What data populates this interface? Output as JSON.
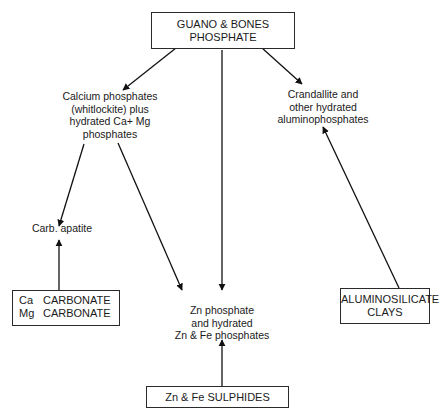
{
  "diagram": {
    "nodes": {
      "guano": {
        "lines": [
          "GUANO & BONES",
          "PHOSPHATE"
        ]
      },
      "calcium": {
        "lines": [
          "Calcium phosphates",
          "(whitlockite) plus",
          "hydrated Ca+ Mg",
          "phosphates"
        ]
      },
      "crandallite": {
        "lines": [
          "Crandallite and",
          "other hydrated",
          "aluminophosphates"
        ]
      },
      "carb_apatite": {
        "lines": [
          "Carb. apatite"
        ]
      },
      "zn_phosphate": {
        "lines": [
          "Zn phosphate",
          "and hydrated",
          "Zn & Fe phosphates"
        ]
      },
      "carbonate": {
        "rows": [
          {
            "element": "Ca",
            "label": "CARBONATE"
          },
          {
            "element": "Mg",
            "label": "CARBONATE"
          }
        ]
      },
      "aluminosilicate": {
        "lines": [
          "ALUMINOSILICATE",
          "CLAYS"
        ]
      },
      "sulphides": {
        "lines": [
          "Zn & Fe SULPHIDES"
        ]
      }
    },
    "edges": [
      {
        "from": "GUANO & BONES PHOSPHATE",
        "to": "Calcium phosphates"
      },
      {
        "from": "GUANO & BONES PHOSPHATE",
        "to": "Zn phosphate"
      },
      {
        "from": "GUANO & BONES PHOSPHATE",
        "to": "Crandallite"
      },
      {
        "from": "Calcium phosphates",
        "to": "Carb. apatite"
      },
      {
        "from": "Calcium phosphates",
        "to": "Zn phosphate"
      },
      {
        "from": "Ca/Mg CARBONATE",
        "to": "Carb. apatite"
      },
      {
        "from": "ALUMINOSILICATE CLAYS",
        "to": "Crandallite"
      },
      {
        "from": "Zn & Fe SULPHIDES",
        "to": "Zn phosphate"
      }
    ]
  }
}
